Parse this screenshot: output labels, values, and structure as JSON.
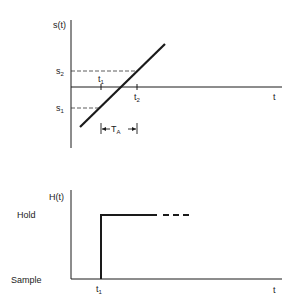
{
  "top_plot": {
    "y_axis_label": "s(t)",
    "x_axis_label": "t",
    "s2_label": "s",
    "s2_sub": "2",
    "s1_label": "s",
    "s1_sub": "1",
    "t1_label": "t",
    "t1_sub": "1",
    "t2_label": "t",
    "t2_sub": "2",
    "interval_label": "T",
    "interval_sub": "A"
  },
  "bottom_plot": {
    "y_axis_label": "H(t)",
    "x_axis_label": "t",
    "hold_label": "Hold",
    "sample_label": "Sample",
    "t1_label": "t",
    "t1_sub": "1"
  },
  "colors": {
    "ink": "#1a1a1a"
  }
}
